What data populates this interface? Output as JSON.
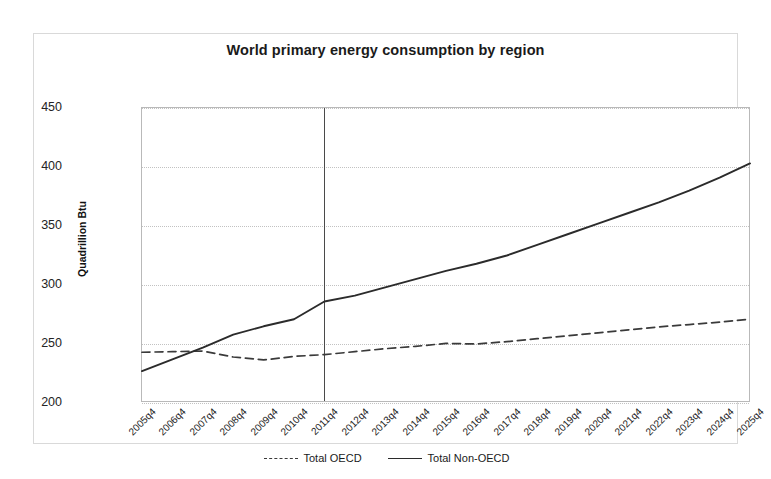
{
  "chart_data": {
    "type": "line",
    "title": "World primary energy consumption by region",
    "xlabel": "",
    "ylabel": "Quadrillion Btu",
    "ylim": [
      200,
      450
    ],
    "yticks": [
      200,
      250,
      300,
      350,
      400,
      450
    ],
    "grid": true,
    "legend_position": "bottom",
    "categories": [
      "2005q4",
      "2006q4",
      "2007q4",
      "2008q4",
      "2009q4",
      "2010q4",
      "2011q4",
      "2012q4",
      "2013q4",
      "2014q4",
      "2015q4",
      "2016q4",
      "2017q4",
      "2018q4",
      "2019q4",
      "2020q4",
      "2021q4",
      "2022q4",
      "2023q4",
      "2024q4",
      "2025q4"
    ],
    "series": [
      {
        "name": "Total OECD",
        "style": "dashed",
        "color": "#3a3a3a",
        "values": [
          243.0,
          243.5,
          244.0,
          239.0,
          236.5,
          239.5,
          241.0,
          243.5,
          246.0,
          248.0,
          250.5,
          250.0,
          252.0,
          254.5,
          257.0,
          259.5,
          262.0,
          264.5,
          266.5,
          268.5,
          271.0
        ]
      },
      {
        "name": "Total Non-OECD",
        "style": "solid",
        "color": "#2b2b2b",
        "values": [
          227.0,
          237.0,
          247.0,
          258.0,
          265.0,
          271.0,
          286.0,
          291.0,
          298.0,
          305.0,
          312.0,
          318.0,
          325.0,
          334.0,
          343.0,
          352.0,
          361.0,
          370.0,
          380.0,
          391.0,
          403.0
        ]
      }
    ],
    "annotations": [
      {
        "type": "vline",
        "at": "2011q4",
        "label": ""
      }
    ]
  },
  "legend": {
    "items": [
      {
        "label": "Total OECD"
      },
      {
        "label": "Total Non-OECD"
      }
    ]
  }
}
